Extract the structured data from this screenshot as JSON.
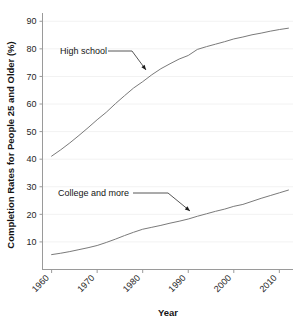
{
  "chart_data": {
    "type": "line",
    "title": "",
    "xlabel": "Year",
    "ylabel": "Completion Rates for People 25 and Older (%)",
    "xlim": [
      1958,
      2013
    ],
    "ylim": [
      0,
      93
    ],
    "xticks": [
      1960,
      1970,
      1980,
      1990,
      2000,
      2010
    ],
    "xtick_labels": [
      "1960",
      "1970",
      "1980",
      "1990",
      "2000",
      "2010"
    ],
    "yticks": [
      10,
      20,
      30,
      40,
      50,
      60,
      70,
      80,
      90
    ],
    "ytick_labels": [
      "10",
      "20",
      "30",
      "40",
      "50",
      "60",
      "70",
      "80",
      "90"
    ],
    "grid": "faint-horizontal",
    "legend": "none",
    "series": [
      {
        "name": "High school",
        "color": "#7a7a7a",
        "x": [
          1960,
          1962,
          1964,
          1966,
          1968,
          1970,
          1972,
          1974,
          1976,
          1978,
          1980,
          1982,
          1984,
          1986,
          1988,
          1990,
          1992,
          1994,
          1996,
          1998,
          2000,
          2002,
          2004,
          2006,
          2008,
          2010,
          2012
        ],
        "values": [
          41.1,
          43.4,
          45.9,
          48.6,
          51.4,
          54.3,
          57.0,
          60.1,
          63.0,
          65.8,
          68.1,
          70.6,
          72.8,
          74.6,
          76.3,
          77.6,
          79.8,
          80.8,
          81.7,
          82.6,
          83.6,
          84.3,
          85.1,
          85.7,
          86.4,
          87.0,
          87.5
        ]
      },
      {
        "name": "College and more",
        "color": "#7a7a7a",
        "x": [
          1960,
          1962,
          1964,
          1966,
          1968,
          1970,
          1972,
          1974,
          1976,
          1978,
          1980,
          1982,
          1984,
          1986,
          1988,
          1990,
          1992,
          1994,
          1996,
          1998,
          2000,
          2002,
          2004,
          2006,
          2008,
          2010,
          2012
        ],
        "values": [
          5.4,
          5.9,
          6.5,
          7.2,
          7.9,
          8.7,
          9.8,
          11.0,
          12.3,
          13.5,
          14.6,
          15.3,
          16.0,
          16.8,
          17.5,
          18.3,
          19.3,
          20.2,
          21.1,
          21.9,
          22.9,
          23.6,
          24.7,
          25.8,
          26.8,
          27.8,
          28.8
        ]
      }
    ],
    "annotations": [
      {
        "label": "High school",
        "text_x": 60,
        "text_y": 54,
        "leader_from_x": 108,
        "leader_from_y": 51,
        "leader_elbow_x": 132,
        "leader_elbow_y": 51,
        "arrow_x": 146,
        "arrow_y": 70
      },
      {
        "label": "College and more",
        "text_x": 58,
        "text_y": 196,
        "leader_from_x": 133,
        "leader_from_y": 193,
        "leader_elbow_x": 168,
        "leader_elbow_y": 193,
        "arrow_x": 190,
        "arrow_y": 211
      }
    ]
  },
  "axis": {
    "x_title": "Year",
    "y_title": "Completion Rates for People 25 and Older (%)"
  },
  "colors": {
    "line": "#7a7a7a",
    "axis": "#9a9a9a",
    "grid": "#f2f2f2",
    "text": "#141414",
    "background": "#ffffff"
  }
}
